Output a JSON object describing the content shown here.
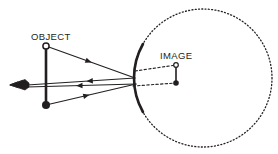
{
  "figure": {
    "type": "optics-ray-diagram",
    "background_color": "#ffffff",
    "stroke_color": "#231f20",
    "width": 278,
    "height": 154
  },
  "labels": {
    "object": "OBJECT",
    "image": "IMAGE"
  },
  "object_arrow": {
    "name": "object",
    "x": 46,
    "top_y": 46,
    "bottom_y": 105,
    "top_marker": "open-circle",
    "bottom_marker": "filled-circle",
    "stroke_width": 2.6
  },
  "image_arrow": {
    "name": "image",
    "x": 176,
    "top_y": 65,
    "bottom_y": 83,
    "top_marker": "open-circle",
    "bottom_marker": "filled-circle",
    "stroke_width": 1.6
  },
  "mirror": {
    "name": "convex-mirror",
    "center_x": 203,
    "center_y": 78,
    "radius": 69,
    "vertex_x": 134,
    "arc_top_y": 44,
    "arc_bottom_y": 112,
    "stroke_width": 2.6
  },
  "sphere": {
    "name": "mirror-sphere-construction-circle",
    "center_x": 203,
    "center_y": 78,
    "radius": 69,
    "style": "dotted",
    "stroke_width": 1.3,
    "dash": "1,2.3"
  },
  "eye": {
    "name": "observer-eye",
    "x": 20,
    "y": 85
  },
  "incident_rays": [
    {
      "name": "incident-ray-from-object-top",
      "from_x": 46,
      "from_y": 46,
      "to_x": 135,
      "to_y": 78,
      "arrow_at": 0.48,
      "arrow_direction": "forward"
    },
    {
      "name": "incident-ray-from-object-bottom",
      "from_x": 46,
      "from_y": 105,
      "to_x": 136,
      "to_y": 84,
      "arrow_at": 0.45,
      "arrow_direction": "forward"
    }
  ],
  "reflected_rays": [
    {
      "name": "reflected-ray-upper-to-eye",
      "from_x": 135,
      "from_y": 78,
      "to_x": 27,
      "to_y": 85,
      "arrow_at": 0.42,
      "arrow_direction": "forward"
    },
    {
      "name": "reflected-ray-lower-to-eye",
      "from_x": 136,
      "from_y": 84,
      "to_x": 27,
      "to_y": 87,
      "arrow_at": 0.52,
      "arrow_direction": "forward"
    }
  ],
  "virtual_extensions": [
    {
      "name": "virtual-extension-to-image-top",
      "from_x": 135,
      "from_y": 71,
      "to_x": 176,
      "to_y": 65,
      "style": "dashed"
    },
    {
      "name": "virtual-extension-to-image-bottom",
      "from_x": 133,
      "from_y": 86,
      "to_x": 176,
      "to_y": 83,
      "style": "dashed"
    }
  ],
  "label_positions": {
    "object": {
      "x": 31,
      "y": 40
    },
    "image": {
      "x": 160,
      "y": 59
    }
  }
}
